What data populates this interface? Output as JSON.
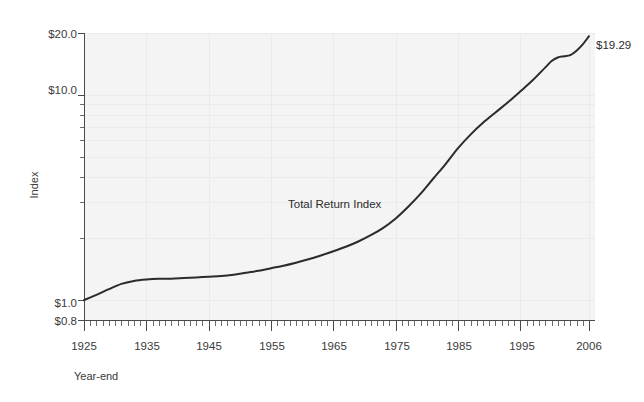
{
  "chart_data": {
    "type": "line",
    "title": "",
    "subtitle": "",
    "xlabel": "Year-end",
    "ylabel": "Index",
    "yscale": "log",
    "ylim": [
      0.8,
      20.0
    ],
    "xlim": [
      1925,
      2006
    ],
    "grid": "faint",
    "legend_position": "inline-annotation",
    "y_ticks_major": [
      "$0.8",
      "$1.0",
      "$10.0",
      "$20.0"
    ],
    "y_tick_values_major": [
      0.8,
      1.0,
      10.0,
      20.0
    ],
    "y_ticks_minor_values": [
      2,
      3,
      4,
      5,
      6,
      7,
      8,
      9
    ],
    "x_ticks": [
      "1925",
      "1935",
      "1945",
      "1955",
      "1965",
      "1975",
      "1985",
      "1995",
      "2006"
    ],
    "x_tick_values": [
      1925,
      1935,
      1945,
      1955,
      1965,
      1975,
      1985,
      1995,
      2006
    ],
    "x_minor_tick_interval": 1,
    "series": [
      {
        "name": "Total Return Index",
        "annotation": "Total Return Index",
        "end_label": "$19.29",
        "color": "#2b2b2b",
        "x": [
          1925,
          1927,
          1929,
          1931,
          1933,
          1935,
          1937,
          1939,
          1941,
          1943,
          1945,
          1947,
          1949,
          1951,
          1953,
          1955,
          1957,
          1959,
          1961,
          1963,
          1965,
          1967,
          1969,
          1971,
          1973,
          1975,
          1977,
          1979,
          1981,
          1983,
          1985,
          1987,
          1989,
          1991,
          1993,
          1995,
          1997,
          1999,
          2000,
          2001,
          2002,
          2003,
          2004,
          2005,
          2006
        ],
        "values": [
          1.0,
          1.06,
          1.13,
          1.2,
          1.24,
          1.26,
          1.27,
          1.27,
          1.28,
          1.29,
          1.3,
          1.31,
          1.33,
          1.36,
          1.39,
          1.43,
          1.47,
          1.52,
          1.58,
          1.65,
          1.73,
          1.82,
          1.93,
          2.07,
          2.25,
          2.5,
          2.85,
          3.3,
          3.9,
          4.6,
          5.5,
          6.4,
          7.3,
          8.2,
          9.2,
          10.4,
          11.8,
          13.6,
          14.6,
          15.2,
          15.4,
          15.6,
          16.4,
          17.6,
          19.29
        ]
      }
    ]
  },
  "labels": {
    "y_axis_title": "Index",
    "x_axis_title": "Year-end",
    "series_annotation": "Total Return Index",
    "endpoint_value": "$19.29",
    "y_top": "$20.0",
    "y_ten": "$10.0",
    "y_one": "$1.0",
    "y_bottom": "$0.8",
    "x1": "1925",
    "x2": "1935",
    "x3": "1945",
    "x4": "1955",
    "x5": "1965",
    "x6": "1975",
    "x7": "1985",
    "x8": "1995",
    "x9": "2006"
  },
  "colors": {
    "plot_background": "#f4f4f4",
    "line": "#2b2b2b",
    "axis": "#6b6b6b",
    "text": "#3a3a3a",
    "gridline": "#ebebeb",
    "page_background": "#ffffff"
  }
}
